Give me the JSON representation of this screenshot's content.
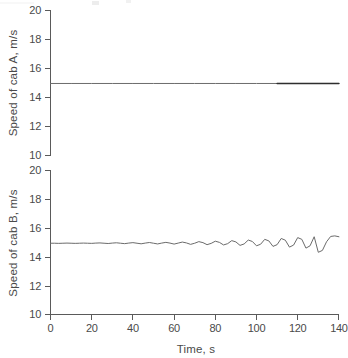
{
  "figure": {
    "background": "#ffffff",
    "line_color": "#6b6b6b",
    "axis_color": "#5a5a5a",
    "emphasis_color": "#2e2e2e"
  },
  "chart_data": [
    {
      "type": "line",
      "id": "cab-a",
      "title": "",
      "xlabel": "",
      "ylabel": "Speed of cab A, m/s",
      "xlim": [
        0,
        140
      ],
      "ylim": [
        10,
        20
      ],
      "yticks": [
        10,
        12,
        14,
        16,
        18,
        20
      ],
      "ytick_labels": [
        "10",
        "12",
        "14",
        "16",
        "18",
        "20"
      ],
      "xticks": [],
      "xtick_labels": [],
      "grid": false,
      "legend": false,
      "x_axis_visible": false,
      "series": [
        {
          "name": "Speed of cab A",
          "x": [
            0,
            10,
            20,
            30,
            40,
            50,
            60,
            70,
            80,
            90,
            100,
            110,
            120,
            130,
            140
          ],
          "values": [
            14.95,
            14.95,
            14.95,
            14.95,
            14.95,
            14.95,
            14.95,
            14.95,
            14.95,
            14.95,
            14.95,
            14.95,
            14.95,
            14.95,
            14.95
          ]
        }
      ],
      "annotations": [
        {
          "kind": "emphasized-segment",
          "note": "darker thicker trace from t=110 to t=140",
          "x_start": 110,
          "x_end": 140,
          "y": 14.95
        }
      ]
    },
    {
      "type": "line",
      "id": "cab-b",
      "title": "",
      "xlabel": "Time, s",
      "ylabel": "Speed of cab B, m/s",
      "xlim": [
        0,
        140
      ],
      "ylim": [
        10,
        20
      ],
      "yticks": [
        10,
        12,
        14,
        16,
        18,
        20
      ],
      "ytick_labels": [
        "10",
        "12",
        "14",
        "16",
        "18",
        "20"
      ],
      "xticks": [
        0,
        20,
        40,
        60,
        80,
        100,
        120,
        140
      ],
      "xtick_labels": [
        "0",
        "20",
        "40",
        "60",
        "80",
        "100",
        "120",
        "140"
      ],
      "grid": false,
      "legend": false,
      "x_axis_visible": true,
      "series": [
        {
          "name": "Speed of cab B",
          "note": "baseline 14.95 m/s with growing oscillation, period about 14 s",
          "x": [
            0,
            2,
            4,
            6,
            8,
            10,
            12,
            14,
            16,
            18,
            20,
            22,
            24,
            26,
            28,
            30,
            32,
            34,
            36,
            38,
            40,
            42,
            44,
            46,
            48,
            50,
            52,
            54,
            56,
            58,
            60,
            62,
            64,
            66,
            68,
            70,
            72,
            74,
            76,
            78,
            80,
            82,
            84,
            86,
            88,
            90,
            92,
            94,
            96,
            98,
            100,
            102,
            104,
            106,
            108,
            110,
            112,
            114,
            116,
            118,
            120,
            122,
            124,
            126,
            128,
            130,
            132,
            134,
            136,
            138,
            140
          ],
          "values": [
            14.95,
            14.95,
            14.94,
            14.95,
            14.96,
            14.95,
            14.94,
            14.95,
            14.96,
            14.95,
            14.94,
            14.96,
            14.97,
            14.95,
            14.93,
            14.96,
            14.98,
            14.95,
            14.92,
            14.96,
            14.99,
            14.95,
            14.91,
            14.96,
            15.0,
            14.95,
            14.9,
            14.96,
            15.01,
            14.96,
            14.89,
            14.96,
            15.03,
            14.97,
            14.87,
            14.95,
            15.06,
            14.99,
            14.85,
            14.94,
            15.09,
            15.01,
            14.83,
            14.92,
            15.13,
            15.04,
            14.8,
            14.9,
            15.17,
            15.07,
            14.77,
            14.88,
            15.22,
            15.11,
            14.73,
            14.85,
            15.28,
            15.16,
            14.68,
            14.82,
            15.34,
            15.22,
            14.61,
            14.77,
            15.4,
            14.32,
            14.45,
            15.05,
            15.42,
            15.46,
            15.4
          ]
        }
      ]
    }
  ]
}
